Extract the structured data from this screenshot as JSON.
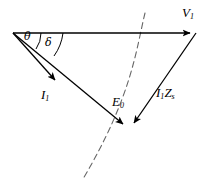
{
  "diagram": {
    "type": "phasor-diagram",
    "background_color": "#ffffff",
    "stroke_color": "#000000",
    "dash_color": "#555555",
    "origin": {
      "x": 13,
      "y": 33
    },
    "labels": {
      "terminal_voltage": {
        "symbol": "V",
        "subscript": "1",
        "x": 182,
        "y": 6
      },
      "armature_current": {
        "symbol": "I",
        "subscript": "1",
        "x": 41,
        "y": 88
      },
      "excitation_emf": {
        "symbol": "E",
        "subscript": "0",
        "x": 112,
        "y": 95
      },
      "impedance_drop": {
        "symbol": "I",
        "subscript": "1",
        "symbol2": "Z",
        "subscript2": "s",
        "x": 156,
        "y": 86
      },
      "power_factor_angle": {
        "symbol": "θ",
        "x": 24,
        "y": 31
      },
      "load_angle": {
        "symbol": "δ",
        "x": 45,
        "y": 37
      }
    },
    "vectors": [
      {
        "name": "V1",
        "description": "terminal voltage phasor, horizontal reference",
        "x1": 13,
        "y1": 33,
        "x2": 196,
        "y2": 33,
        "arrow": "end"
      },
      {
        "name": "I1",
        "description": "armature current phasor lagging V1 by theta",
        "x1": 13,
        "y1": 33,
        "x2": 60,
        "y2": 86,
        "arrow": "end"
      },
      {
        "name": "E0",
        "description": "no-load generated emf phasor lagging V1 by delta",
        "x1": 13,
        "y1": 33,
        "x2": 127,
        "y2": 128,
        "arrow": "end"
      },
      {
        "name": "I1Zs",
        "description": "synchronous impedance voltage drop, from V1 tip to E0 tip",
        "x1": 196,
        "y1": 33,
        "x2": 131,
        "y2": 128,
        "arrow": "end"
      }
    ],
    "arcs": [
      {
        "name": "theta-arc",
        "description": "angle between V1 axis and I1 phasor",
        "path": "M 41 33 A 28 28 0 0 1 35 50",
        "dashed": false
      },
      {
        "name": "delta-arc",
        "description": "angle between V1 axis and E0 phasor",
        "path": "M 63 33 A 50 50 0 0 1 53 55",
        "dashed": false
      },
      {
        "name": "emf-locus-arc",
        "description": "dashed circular locus arc of constant excitation emf",
        "path": "M 145 13 C 136 50, 132 96, 83 179",
        "dashed": true
      }
    ]
  }
}
